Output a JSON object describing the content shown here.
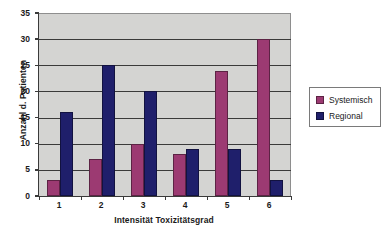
{
  "chart_data": {
    "type": "bar",
    "title": "",
    "categories": [
      "1",
      "2",
      "3",
      "4",
      "5",
      "6"
    ],
    "series": [
      {
        "name": "Systemisch",
        "values": [
          3,
          7,
          10,
          8,
          24,
          30
        ],
        "color": "#9c3a72"
      },
      {
        "name": "Regional",
        "values": [
          16,
          25,
          20,
          9,
          9,
          3
        ],
        "color": "#1f1f6b"
      }
    ],
    "xlabel": "Intensität Toxizitätsgrad",
    "ylabel": "Anzahl d. Patienten",
    "ylim": [
      0,
      35
    ],
    "ytick_step": 5,
    "yticks": [
      "0",
      "5",
      "10",
      "15",
      "20",
      "25",
      "30",
      "35"
    ],
    "grid": "horizontal",
    "legend_position": "right",
    "plot_background": "#d4d4d2",
    "axis_color": "#3a3a3a",
    "figure_background": "#ffffff"
  },
  "legend": {
    "entries": [
      {
        "label": "Systemisch",
        "swatch": "systemisch"
      },
      {
        "label": "Regional",
        "swatch": "regional"
      }
    ]
  }
}
